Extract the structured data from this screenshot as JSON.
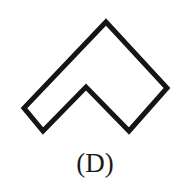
{
  "figure": {
    "caption": "(D)",
    "background_color": "#ffffff",
    "stroke_color": "#151515",
    "fill_color": "#ffffff",
    "stroke_width": 5,
    "shape_name": "chevron-outline",
    "shape_description": "Closed chevron / arrowhead outline: a rotated square with a triangular notch cut out of its lower side",
    "vertices": [
      {
        "label": "top-apex",
        "x": 106,
        "y": 22
      },
      {
        "label": "right-corner",
        "x": 167,
        "y": 88
      },
      {
        "label": "bottom-right-corner",
        "x": 129,
        "y": 131
      },
      {
        "label": "inner-apex",
        "x": 86,
        "y": 87
      },
      {
        "label": "bottom-left-corner",
        "x": 43,
        "y": 131
      },
      {
        "label": "left-corner",
        "x": 24,
        "y": 108
      }
    ],
    "path": "M 106 22 L 167 88 L 129 131 L 86 87 L 43 131 L 24 108 Z"
  }
}
